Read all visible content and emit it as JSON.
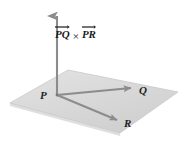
{
  "figure": {
    "background_color": "#ffffff",
    "plane": {
      "name": "plane-PQR",
      "fill_color": "#dcdcdc",
      "edge_color": "#c8c8c8",
      "corners": [
        [
          68,
          70
        ],
        [
          178,
          92
        ],
        [
          120,
          133
        ],
        [
          10,
          103
        ]
      ]
    },
    "vectors": [
      {
        "id": "cross-product",
        "label": "PQ × PR",
        "from": [
          57,
          95
        ],
        "to": [
          57,
          10
        ],
        "color": "#8c8c8c"
      },
      {
        "id": "PQ",
        "label": "Q",
        "from": [
          57,
          95
        ],
        "to": [
          136,
          88
        ],
        "color": "#8c8c8c"
      },
      {
        "id": "PR",
        "label": "R",
        "from": [
          57,
          95
        ],
        "to": [
          122,
          122
        ],
        "color": "#8c8c8c"
      }
    ],
    "labels": {
      "point_p": "P",
      "point_q": "Q",
      "point_r": "R"
    },
    "expression": {
      "first_vector": "PQ",
      "operator": "×",
      "second_vector": "PR"
    },
    "colors": {
      "arrow": "#8c8c8c",
      "plane_fill": "#dcdcdc",
      "text": "#1a1a1a"
    }
  }
}
